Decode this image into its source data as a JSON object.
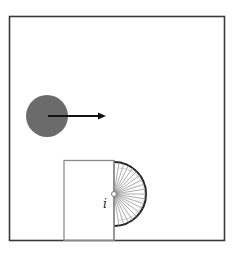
{
  "diagram": {
    "labels": {
      "pivot_label": "i"
    },
    "colors": {
      "frame": "#3a3a3a",
      "ball": "#6b6b6b",
      "arrow": "#111111",
      "door": "#777777",
      "wheel_arc": "#222222",
      "spokes": "#888888"
    }
  }
}
